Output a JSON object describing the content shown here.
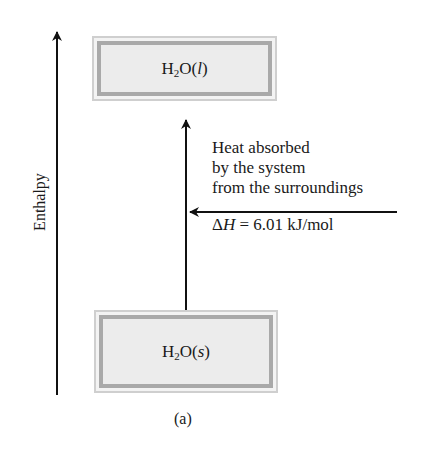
{
  "diagram": {
    "type": "enthalpy-diagram",
    "axis": {
      "label": "Enthalpy",
      "direction": "up"
    },
    "upper_state": {
      "formula_base": "H",
      "formula_sub": "2",
      "formula_rest": "O(",
      "phase": "l",
      "close": ")"
    },
    "lower_state": {
      "formula_base": "H",
      "formula_sub": "2",
      "formula_rest": "O(",
      "phase": "s",
      "close": ")"
    },
    "transition": {
      "direction": "up",
      "from": "H2O(s)",
      "to": "H2O(l)"
    },
    "annotation": {
      "lines": [
        "Heat absorbed",
        "by the system",
        "from the surroundings"
      ],
      "delta_symbol": "Δ",
      "delta_var": "H",
      "delta_value": " = 6.01 kJ/mol"
    },
    "caption": "(a)",
    "colors": {
      "line": "#111111",
      "box_fill": "#ececec",
      "box_border": "#a9a9a9"
    }
  }
}
